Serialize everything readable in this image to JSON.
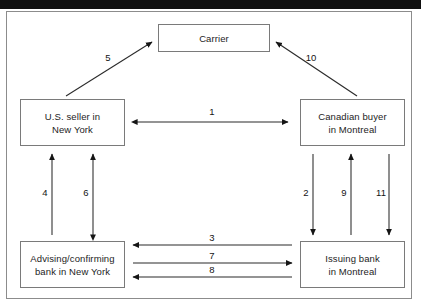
{
  "diagram": {
    "nodes": [
      {
        "id": "carrier",
        "label": "Carrier"
      },
      {
        "id": "seller",
        "line1": "U.S. seller in",
        "line2": "New York"
      },
      {
        "id": "buyer",
        "line1": "Canadian buyer",
        "line2": "in Montreal"
      },
      {
        "id": "advbank",
        "line1": "Advising/confirming",
        "line2": "bank in New York"
      },
      {
        "id": "issuebank",
        "line1": "Issuing bank",
        "line2": "in Montreal"
      }
    ],
    "edges": [
      {
        "id": "e1",
        "label": "1",
        "from": "seller",
        "to": "buyer",
        "direction": "both",
        "orientation": "horizontal"
      },
      {
        "id": "e2",
        "label": "2",
        "from": "buyer",
        "to": "issuebank",
        "direction": "down",
        "orientation": "vertical"
      },
      {
        "id": "e3",
        "label": "3",
        "from": "issuebank",
        "to": "advbank",
        "direction": "left",
        "orientation": "horizontal"
      },
      {
        "id": "e4",
        "label": "4",
        "from": "advbank",
        "to": "seller",
        "direction": "up",
        "orientation": "vertical"
      },
      {
        "id": "e5",
        "label": "5",
        "from": "seller",
        "to": "carrier",
        "direction": "to",
        "orientation": "diagonal"
      },
      {
        "id": "e6",
        "label": "6",
        "from": "advbank",
        "to": "seller",
        "direction": "both",
        "orientation": "vertical"
      },
      {
        "id": "e7",
        "label": "7",
        "from": "advbank",
        "to": "issuebank",
        "direction": "right",
        "orientation": "horizontal"
      },
      {
        "id": "e8",
        "label": "8",
        "from": "issuebank",
        "to": "advbank",
        "direction": "left",
        "orientation": "horizontal"
      },
      {
        "id": "e9",
        "label": "9",
        "from": "issuebank",
        "to": "buyer",
        "direction": "up",
        "orientation": "vertical"
      },
      {
        "id": "e10",
        "label": "10",
        "from": "buyer",
        "to": "carrier",
        "direction": "to",
        "orientation": "diagonal"
      },
      {
        "id": "e11",
        "label": "11",
        "from": "buyer",
        "to": "issuebank",
        "direction": "down",
        "orientation": "vertical"
      }
    ],
    "colors": {
      "frame_border": "#8c8c8c",
      "node_border": "#7a7a7a",
      "edge_stroke": "#2a2a2a",
      "text": "#1d1d1d",
      "background": "#ffffff",
      "scan_bar": "#101010"
    }
  }
}
